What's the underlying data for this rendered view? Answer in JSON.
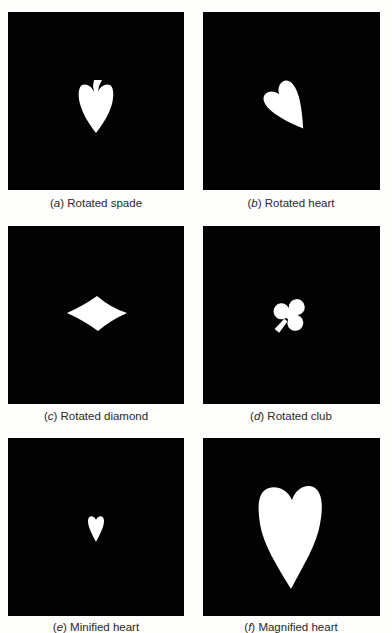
{
  "figure": {
    "panels": [
      {
        "id": "a",
        "label": "a",
        "caption": "Rotated spade",
        "shape": "spade",
        "transform": "rotated"
      },
      {
        "id": "b",
        "label": "b",
        "caption": "Rotated heart",
        "shape": "heart",
        "transform": "rotated"
      },
      {
        "id": "c",
        "label": "c",
        "caption": "Rotated diamond",
        "shape": "diamond",
        "transform": "rotated"
      },
      {
        "id": "d",
        "label": "d",
        "caption": "Rotated club",
        "shape": "club",
        "transform": "rotated"
      },
      {
        "id": "e",
        "label": "e",
        "caption": "Minified heart",
        "shape": "heart",
        "transform": "minified"
      },
      {
        "id": "f",
        "label": "f",
        "caption": "Magnified heart",
        "shape": "heart",
        "transform": "magnified"
      }
    ],
    "colors": {
      "page_background": "#fdfdfb",
      "panel_background": "#020202",
      "shape_fill": "#ffffff",
      "caption_text": "#2a2a2a"
    }
  }
}
